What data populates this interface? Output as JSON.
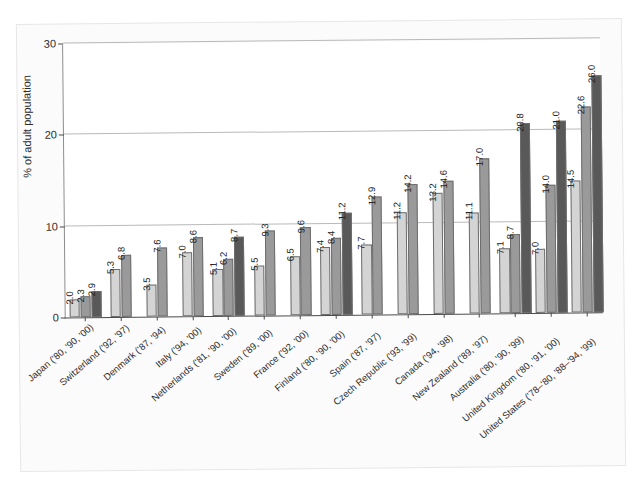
{
  "chart_data": {
    "type": "bar",
    "title": "",
    "xlabel": "",
    "ylabel": "% of adult population",
    "ylim": [
      0,
      30
    ],
    "yticks": [
      0,
      10,
      20,
      30
    ],
    "grid": true,
    "legend": "none",
    "grouped": true,
    "series_colors": [
      "#d4d4d4",
      "#9a9a9a",
      "#595959"
    ],
    "categories": [
      "Japan ('80, '90, '00)",
      "Switzerland ('92, '97)",
      "Denmark ('87, '94)",
      "Italy ('94, '00)",
      "Netherlands ('81, '90, '00)",
      "Sweden ('89, '00)",
      "France ('92, '00)",
      "Finland ('80, '90, '00)",
      "Spain ('87, '97)",
      "Czech Republic ('93, '99)",
      "Canada ('94, '98)",
      "New Zealand ('89, '97)",
      "Australia ('80, '90, '99)",
      "United Kingdom ('80, '91, '00)",
      "United States ('78–'80, '88–'94, '99)"
    ],
    "groups": [
      {
        "label": "Japan ('80, '90, '00)",
        "values": [
          2.0,
          2.3,
          2.9
        ]
      },
      {
        "label": "Switzerland ('92, '97)",
        "values": [
          5.3,
          6.8
        ]
      },
      {
        "label": "Denmark ('87, '94)",
        "values": [
          3.5,
          7.6
        ]
      },
      {
        "label": "Italy ('94, '00)",
        "values": [
          7.0,
          8.6
        ]
      },
      {
        "label": "Netherlands ('81, '90, '00)",
        "values": [
          5.1,
          6.2,
          8.7
        ]
      },
      {
        "label": "Sweden ('89, '00)",
        "values": [
          5.5,
          9.3
        ]
      },
      {
        "label": "France ('92, '00)",
        "values": [
          6.5,
          9.6
        ]
      },
      {
        "label": "Finland ('80, '90, '00)",
        "values": [
          7.4,
          8.4,
          11.2
        ]
      },
      {
        "label": "Spain ('87, '97)",
        "values": [
          7.7,
          12.9
        ]
      },
      {
        "label": "Czech Republic ('93, '99)",
        "values": [
          11.2,
          14.2
        ]
      },
      {
        "label": "Canada ('94, '98)",
        "values": [
          13.2,
          14.6
        ]
      },
      {
        "label": "New Zealand ('89, '97)",
        "values": [
          11.1,
          17.0
        ]
      },
      {
        "label": "Australia ('80, '90, '99)",
        "values": [
          7.1,
          8.7,
          20.8
        ]
      },
      {
        "label": "United Kingdom ('80, '91, '00)",
        "values": [
          7.0,
          14.0,
          21.0
        ]
      },
      {
        "label": "United States ('78–'80, '88–'94, '99)",
        "values": [
          14.5,
          22.6,
          26.0
        ]
      }
    ],
    "value_labels": [
      [
        "2.0",
        "2.3",
        "2.9"
      ],
      [
        "5.3",
        "6.8"
      ],
      [
        "3.5",
        "7.6"
      ],
      [
        "7.0",
        "8.6"
      ],
      [
        "5.1",
        "6.2",
        "8.7"
      ],
      [
        "5.5",
        "9.3"
      ],
      [
        "6.5",
        "9.6"
      ],
      [
        "7.4",
        "8.4",
        "11.2"
      ],
      [
        "7.7",
        "12.9"
      ],
      [
        "11.2",
        "14.2"
      ],
      [
        "13.2",
        "14.6"
      ],
      [
        "11.1",
        "17.0"
      ],
      [
        "7.1",
        "8.7",
        "20.8"
      ],
      [
        "7.0",
        "14.0",
        "21.0"
      ],
      [
        "14.5",
        "22.6",
        "26.0"
      ]
    ]
  }
}
